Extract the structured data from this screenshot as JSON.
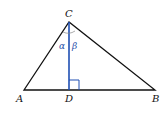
{
  "diagram": {
    "type": "triangle-with-altitude",
    "colors": {
      "triangle": "#111111",
      "altitude": "#1f4fb3",
      "arc": "#777777"
    },
    "points": {
      "A": {
        "label": "A",
        "x": 24,
        "y": 90
      },
      "B": {
        "label": "B",
        "x": 155,
        "y": 90
      },
      "C": {
        "label": "C",
        "x": 69,
        "y": 22
      },
      "D": {
        "label": "D",
        "x": 69,
        "y": 90
      }
    },
    "angles": {
      "alpha": "α",
      "beta": "β"
    },
    "right_angle_at": "D"
  }
}
